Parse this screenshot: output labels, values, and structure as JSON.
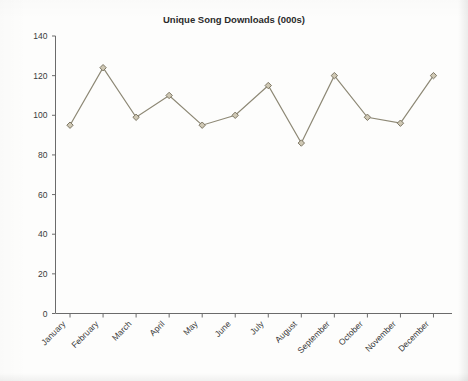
{
  "chart_data": {
    "type": "line",
    "title": "Unique Song Downloads (000s)",
    "xlabel": "",
    "ylabel": "",
    "categories": [
      "January",
      "February",
      "March",
      "April",
      "May",
      "June",
      "July",
      "August",
      "September",
      "October",
      "November",
      "December"
    ],
    "values": [
      95,
      124,
      99,
      110,
      95,
      100,
      115,
      86,
      120,
      99,
      96,
      120
    ],
    "series": [
      {
        "name": "Unique Song Downloads (000s)",
        "values": [
          95,
          124,
          99,
          110,
          95,
          100,
          115,
          86,
          120,
          99,
          96,
          120
        ]
      }
    ],
    "ylim": [
      0,
      140
    ],
    "yticks": [
      0,
      20,
      40,
      60,
      80,
      100,
      120,
      140
    ],
    "ytick_labels": [
      "0",
      "20",
      "40",
      "60",
      "80",
      "100",
      "120",
      "140"
    ],
    "grid": false,
    "legend": false,
    "legend_position": "none",
    "marker": "diamond",
    "line_color": "#8d8875",
    "marker_fill": "#cfc8b4",
    "marker_stroke": "#7d7765",
    "axis_color": "#6b6b6b",
    "background_color": "#fdfdfc",
    "xtick_label_rotation": -45
  }
}
